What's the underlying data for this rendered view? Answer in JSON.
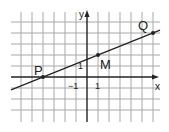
{
  "chart_data": {
    "type": "line",
    "title": "",
    "xlabel": "x",
    "ylabel": "y",
    "xlim": [
      -6,
      6.5
    ],
    "ylim": [
      -4,
      5
    ],
    "grid": true,
    "tick_labels": {
      "x": [
        {
          "value": -1,
          "label": "−1"
        },
        {
          "value": 1,
          "label": "1"
        }
      ],
      "y": [
        {
          "value": 1,
          "label": "1"
        }
      ]
    },
    "series": [
      {
        "name": "line PQ",
        "x": [
          -4,
          1,
          6
        ],
        "y": [
          0,
          2,
          4
        ],
        "slope": 0.4,
        "intercept": 1.6
      }
    ],
    "points": [
      {
        "label": "P",
        "x": -4,
        "y": 0
      },
      {
        "label": "M",
        "x": 1,
        "y": 2
      },
      {
        "label": "Q",
        "x": 6,
        "y": 4
      }
    ]
  },
  "labels": {
    "x_axis": "x",
    "y_axis": "y",
    "x_tick_neg1": "−1",
    "x_tick_1": "1",
    "y_tick_1": "1",
    "point_p": "P",
    "point_m": "M",
    "point_q": "Q"
  },
  "colors": {
    "grid": "#a8a8a8",
    "axis": "#222222",
    "line": "#222222"
  }
}
